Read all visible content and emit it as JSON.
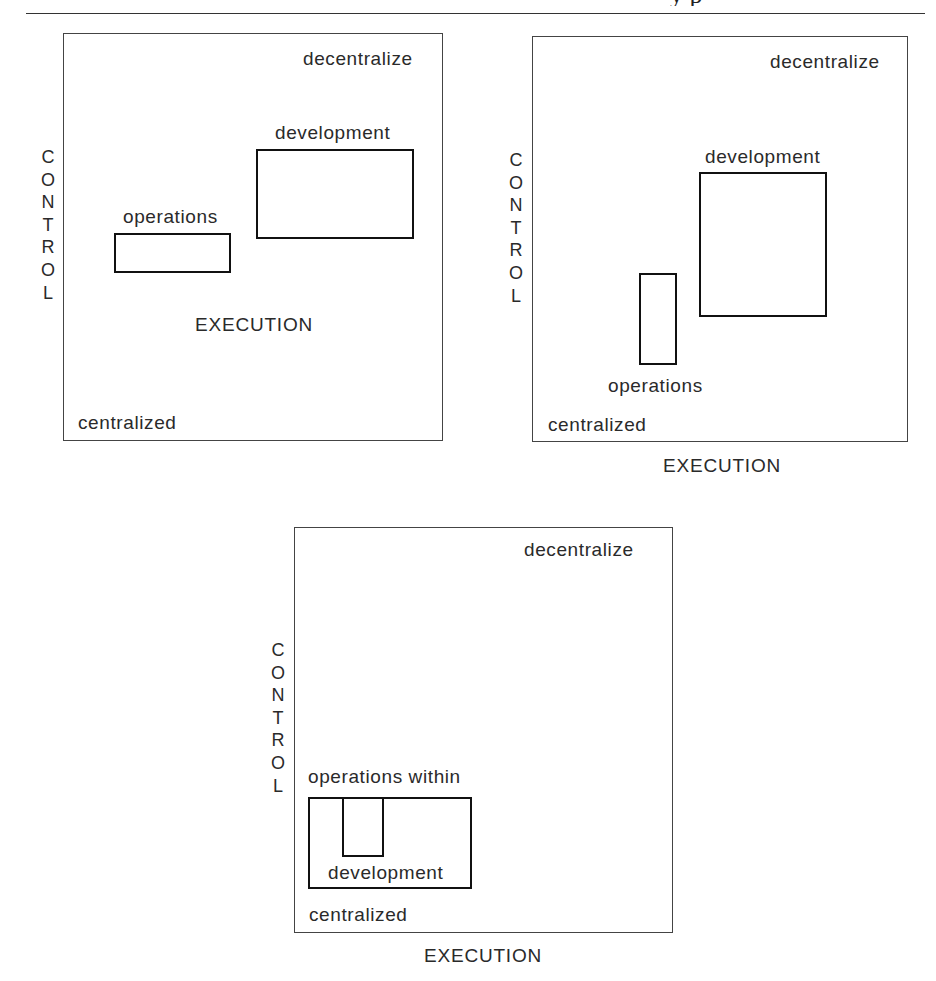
{
  "header": {
    "clipped_running_head": "y p"
  },
  "diagrams": [
    {
      "id": "panel-1",
      "corner_top_right": "decentralize",
      "corner_bottom_left": "centralized",
      "x_axis_label": "EXECUTION",
      "y_axis_label": "CONTROL",
      "y_axis_letters": [
        "C",
        "O",
        "N",
        "T",
        "R",
        "O",
        "L"
      ],
      "boxes": [
        {
          "label": "operations"
        },
        {
          "label": "development"
        }
      ]
    },
    {
      "id": "panel-2",
      "corner_top_right": "decentralize",
      "corner_bottom_left": "centralized",
      "x_axis_label": "EXECUTION",
      "y_axis_label": "CONTROL",
      "y_axis_letters": [
        "C",
        "O",
        "N",
        "T",
        "R",
        "O",
        "L"
      ],
      "boxes": [
        {
          "label": "development"
        },
        {
          "label": "operations"
        }
      ]
    },
    {
      "id": "panel-3",
      "corner_top_right": "decentralize",
      "corner_bottom_left": "centralized",
      "x_axis_label": "EXECUTION",
      "y_axis_label": "CONTROL",
      "y_axis_letters": [
        "C",
        "O",
        "N",
        "T",
        "R",
        "O",
        "L"
      ],
      "boxes": [
        {
          "label": "operations within"
        },
        {
          "label": "development"
        }
      ]
    }
  ]
}
